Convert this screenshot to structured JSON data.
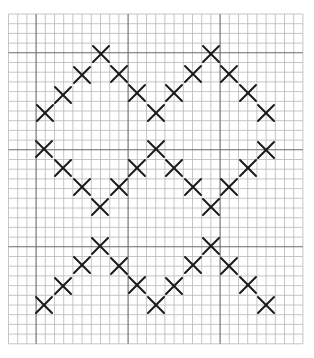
{
  "pattern": {
    "description": "Cross-stitch chart of a zigzag chevron pattern on graph paper",
    "grid": {
      "cols": 32,
      "rows": 34,
      "origin": [
        8.5,
        14
      ],
      "cell_w": 9.2,
      "cell_h": 9.7,
      "major_cols": [
        3,
        13,
        23
      ],
      "major_rows": [
        4,
        14,
        24
      ],
      "minor_color": "#b8b8b8",
      "major_color": "#6a6a6a"
    },
    "stitch": {
      "symbol": "X",
      "color": "#1a1a1a",
      "half_size": 8
    },
    "bands": [
      {
        "name": "top-band",
        "marks": [
          [
            45,
            113
          ],
          [
            63,
            95
          ],
          [
            82,
            75
          ],
          [
            101,
            54
          ],
          [
            119,
            74
          ],
          [
            137,
            93
          ],
          [
            156,
            113
          ],
          [
            174,
            93
          ],
          [
            193,
            74
          ],
          [
            211,
            54
          ],
          [
            229,
            74
          ],
          [
            248,
            93
          ],
          [
            266,
            113
          ]
        ]
      },
      {
        "name": "middle-band",
        "marks": [
          [
            44,
            149
          ],
          [
            63,
            168
          ],
          [
            82,
            187
          ],
          [
            100,
            207
          ],
          [
            119,
            187
          ],
          [
            137,
            168
          ],
          [
            156,
            149
          ],
          [
            174,
            168
          ],
          [
            193,
            187
          ],
          [
            211,
            207
          ],
          [
            229,
            187
          ],
          [
            248,
            168
          ],
          [
            266,
            150
          ]
        ]
      },
      {
        "name": "bottom-band",
        "marks": [
          [
            44,
            305
          ],
          [
            63,
            286
          ],
          [
            82,
            265
          ],
          [
            100,
            246
          ],
          [
            119,
            266
          ],
          [
            137,
            285
          ],
          [
            156,
            305
          ],
          [
            174,
            286
          ],
          [
            193,
            265
          ],
          [
            211,
            246
          ],
          [
            229,
            266
          ],
          [
            248,
            285
          ],
          [
            266,
            305
          ]
        ]
      }
    ]
  }
}
